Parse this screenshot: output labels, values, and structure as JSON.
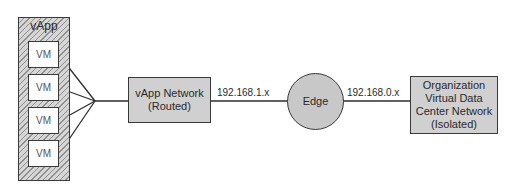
{
  "diagram": {
    "vapp": {
      "label": "vApp",
      "vms": [
        "VM",
        "VM",
        "VM",
        "VM"
      ]
    },
    "vapp_network": {
      "line1": "vApp Network",
      "line2": "(Routed)"
    },
    "link1_label": "192.168.1.x",
    "edge": {
      "label": "Edge"
    },
    "link2_label": "192.168.0.x",
    "org_network": {
      "line1": "Organization",
      "line2": "Virtual Data",
      "line3": "Center Network",
      "line4": "(Isolated)"
    },
    "colors": {
      "stroke": "#3a3a3a",
      "box_fill": "#d0d0d0",
      "edge_fill": "#c8c8c8",
      "vm_fill": "#ffffff"
    }
  }
}
